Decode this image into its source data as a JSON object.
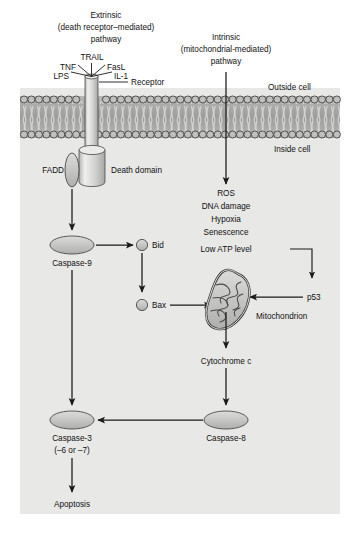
{
  "figure": {
    "background_color": "#ffffff",
    "cell_interior_color": "#e8e8e6",
    "membrane_color": "#a8a8a6",
    "shape_fill": "#c4c4c2",
    "line_color": "#1a1a1a"
  },
  "headers": {
    "extrinsic": {
      "line1": "Extrinsic",
      "line2": "(death receptor–mediated)",
      "line3": "pathway"
    },
    "intrinsic": {
      "line1": "Intrinsic",
      "line2": "(mitochondrial-mediated)",
      "line3": "pathway"
    }
  },
  "ligands": [
    {
      "label": "TRAIL"
    },
    {
      "label": "TNF"
    },
    {
      "label": "FasL"
    },
    {
      "label": "LPS"
    },
    {
      "label": "IL-1"
    }
  ],
  "membrane": {
    "receptor_label": "Receptor",
    "outside_label": "Outside cell",
    "inside_label": "Inside cell"
  },
  "extrinsic_nodes": {
    "fadd": "FADD",
    "death_domain": "Death domain",
    "caspase9": "Caspase-9",
    "caspase3_line1": "Caspase-3",
    "caspase3_line2": "(–6 or –7)",
    "apoptosis": "Apoptosis"
  },
  "bcl2_nodes": {
    "bid": "Bid",
    "bax": "Bax"
  },
  "intrinsic_stressors": [
    "ROS",
    "DNA damage",
    "Hypoxia",
    "Senescence",
    "Low ATP level"
  ],
  "intrinsic_nodes": {
    "p53": "p53",
    "mitochondrion": "Mitochondrion",
    "cytochrome_c": "Cytochrome c",
    "caspase8": "Caspase-8"
  }
}
